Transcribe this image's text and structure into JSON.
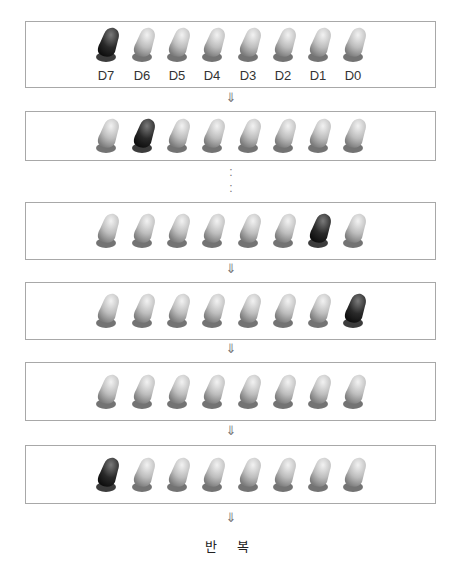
{
  "diagram": {
    "bit_labels": [
      "D7",
      "D6",
      "D5",
      "D4",
      "D3",
      "D2",
      "D1",
      "D0"
    ],
    "colors": {
      "led_on": "#1e1e1e",
      "led_off": "#c8c8c8",
      "border": "#a8a8a8"
    },
    "stages": [
      {
        "name": "stage-1",
        "lit_index": 0,
        "show_labels": true
      },
      {
        "name": "stage-2",
        "lit_index": 1,
        "show_labels": false
      },
      {
        "name": "stage-7",
        "lit_index": 6,
        "show_labels": false
      },
      {
        "name": "stage-8",
        "lit_index": 7,
        "show_labels": false
      },
      {
        "name": "stage-all-off",
        "lit_index": -1,
        "show_labels": false
      },
      {
        "name": "stage-restart",
        "lit_index": 0,
        "show_labels": false
      }
    ],
    "arrow_symbol": "⇓",
    "ellipsis_symbol": ":",
    "repeat_label": "반 복"
  }
}
